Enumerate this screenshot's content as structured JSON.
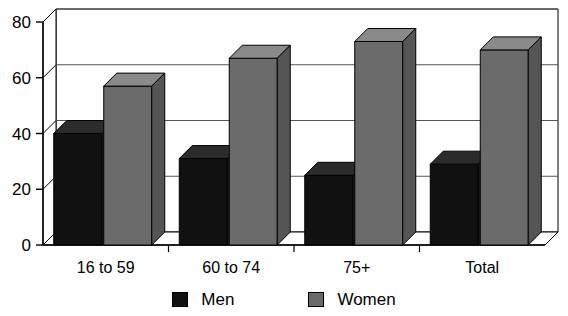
{
  "chart_data": {
    "type": "bar",
    "title": "",
    "subtitle": "",
    "xlabel": "",
    "ylabel": "",
    "categories": [
      "16 to 59",
      "60 to 74",
      "75+",
      "Total"
    ],
    "series": [
      {
        "name": "Men",
        "color": "#111111",
        "values": [
          40,
          31,
          25,
          29
        ]
      },
      {
        "name": "Women",
        "color": "#6b6b6b",
        "values": [
          57,
          67,
          73,
          70
        ]
      }
    ],
    "ylim": [
      0,
      80
    ],
    "yticks": [
      0,
      20,
      40,
      60,
      80
    ],
    "ytick_labels": [
      "0",
      "20",
      "40",
      "60",
      "80"
    ],
    "grid": true,
    "grid_axis": "y",
    "legend_position": "bottom",
    "style": "3d-perspective",
    "annotations": []
  },
  "legend": {
    "entries": [
      {
        "label": "Men",
        "swatch": "black-swatch-icon"
      },
      {
        "label": "Women",
        "swatch": "gray-swatch-icon"
      }
    ]
  },
  "colors": {
    "men": "#111111",
    "men_top": "#2b2b2b",
    "men_side": "#1d1d1d",
    "women": "#6b6b6b",
    "women_top": "#8a8a8a",
    "women_side": "#555555",
    "axis": "#000000",
    "grid": "#555555",
    "background": "#ffffff"
  }
}
